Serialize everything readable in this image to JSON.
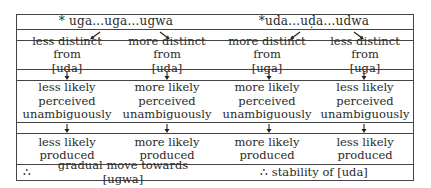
{
  "diagram": {
    "left": {
      "header": "* uga...uga...ugwa",
      "branches": [
        {
          "distinctness": [
            "less distinct from",
            "[uda]"
          ],
          "perception": [
            "less likely",
            "perceived",
            "unambiguously"
          ],
          "production": [
            "less likely",
            "produced"
          ]
        },
        {
          "distinctness": [
            "more distinct from",
            "[uda]"
          ],
          "perception": [
            "more likely",
            "perceived",
            "unambiguously"
          ],
          "production": [
            "more likely",
            "produced"
          ]
        }
      ],
      "conclusion_symbol": "∴",
      "conclusion": "gradual move towards [ugwa]"
    },
    "right": {
      "header": "*uda...uḍa...udwa",
      "branches": [
        {
          "distinctness": [
            "more distinct from",
            "[uga]"
          ],
          "perception": [
            "more likely",
            "perceived",
            "unambiguously"
          ],
          "production": [
            "more likely",
            "produced"
          ]
        },
        {
          "distinctness": [
            "less distinct from",
            "[uga]"
          ],
          "perception": [
            "less likely",
            "perceived",
            "unambiguously"
          ],
          "production": [
            "less likely",
            "produced"
          ]
        }
      ],
      "conclusion": "∴ stability of [uda]"
    },
    "arrow_icons": {
      "header_split_left": "arrow-down-left-icon",
      "header_split_right": "arrow-down-right-icon",
      "down": "arrow-down-icon"
    }
  }
}
